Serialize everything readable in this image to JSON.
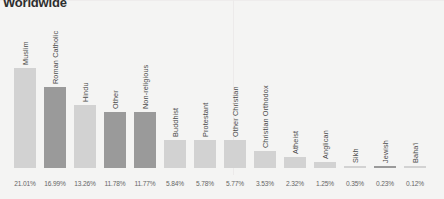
{
  "chart_title": "Worldwide",
  "chart_data": {
    "type": "bar",
    "title": "Worldwide",
    "xlabel": "",
    "ylabel": "",
    "ylim": [
      0,
      23
    ],
    "grid": false,
    "legend": false,
    "categories": [
      "Muslim",
      "Roman Catholic",
      "Hindu",
      "Other",
      "Non-religious",
      "Buddhist",
      "Protestant",
      "Other Christian",
      "Christian Orthodox",
      "Atheist",
      "Anglican",
      "Sikh",
      "Jewish",
      "Baha'i"
    ],
    "values": [
      21.01,
      16.99,
      13.26,
      11.78,
      11.77,
      5.84,
      5.78,
      5.77,
      3.53,
      2.32,
      1.25,
      0.35,
      0.23,
      0.12
    ],
    "value_labels": [
      "21.01%",
      "16.99%",
      "13.26%",
      "11.78%",
      "11.77%",
      "5.84%",
      "5.78%",
      "5.77%",
      "3.53%",
      "2.32%",
      "1.25%",
      "0.35%",
      "0.23%",
      "0.12%"
    ],
    "bar_shades": [
      "light",
      "dark",
      "light",
      "dark",
      "dark",
      "light",
      "light",
      "light",
      "light",
      "light",
      "light",
      "light",
      "dark",
      "light"
    ],
    "colors": {
      "bar_light": "#d2d2d2",
      "bar_dark": "#9a9a9a",
      "background": "#f4f4f3",
      "label_text": "#4a4a4a",
      "value_text": "#666666",
      "title_text": "#2e2e2e"
    }
  }
}
